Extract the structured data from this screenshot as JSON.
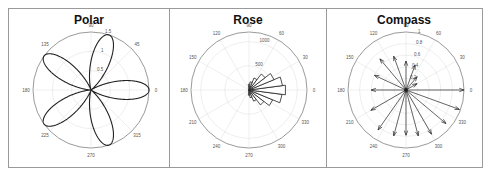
{
  "panels": [
    {
      "id": "polar",
      "title": "Polar"
    },
    {
      "id": "rose",
      "title": "Rose"
    },
    {
      "id": "compass",
      "title": "Compass"
    }
  ],
  "chart_data": [
    {
      "type": "line",
      "title": "Polar",
      "subtype": "polar rose curve (5 petals)",
      "angle_ticks": [
        "0",
        "45",
        "90",
        "135",
        "180",
        "225",
        "270",
        "315"
      ],
      "radial_ticks": [
        "0.5",
        "1",
        "1.5"
      ],
      "rlim": [
        0,
        1.5
      ],
      "petal_angles_deg": [
        0,
        72,
        144,
        216,
        288
      ],
      "petal_max_r": 1.5
    },
    {
      "type": "bar",
      "title": "Rose",
      "subtype": "rose histogram",
      "angle_ticks": [
        "0",
        "30",
        "60",
        "90",
        "120",
        "150",
        "180",
        "210",
        "240",
        "270",
        "300",
        "330"
      ],
      "radial_ticks": [
        "500",
        "1000"
      ],
      "rlim": [
        0,
        1200
      ],
      "bin_centers_deg": [
        -90,
        -75,
        -60,
        -45,
        -30,
        -15,
        0,
        15,
        30,
        45,
        60,
        75,
        90
      ],
      "counts": [
        110,
        160,
        250,
        390,
        530,
        690,
        760,
        700,
        560,
        420,
        270,
        170,
        120
      ]
    },
    {
      "type": "scatter",
      "title": "Compass",
      "subtype": "compass arrows",
      "angle_ticks": [
        "0",
        "30",
        "60",
        "90",
        "120",
        "150",
        "180",
        "210",
        "240",
        "270",
        "300",
        "330"
      ],
      "radial_ticks": [
        "0.2",
        "0.4",
        "0.6",
        "0.8",
        "1"
      ],
      "rlim": [
        0,
        1
      ],
      "arrows": [
        {
          "angle": 0,
          "r": 1.0
        },
        {
          "angle": -20,
          "r": 0.98
        },
        {
          "angle": -40,
          "r": 0.9
        },
        {
          "angle": -60,
          "r": 0.88
        },
        {
          "angle": -75,
          "r": 0.82
        },
        {
          "angle": -90,
          "r": 0.78
        },
        {
          "angle": -105,
          "r": 0.82
        },
        {
          "angle": -125,
          "r": 0.84
        },
        {
          "angle": -150,
          "r": 0.7
        },
        {
          "angle": 180,
          "r": 0.6
        },
        {
          "angle": 155,
          "r": 0.6
        },
        {
          "angle": 130,
          "r": 0.7
        },
        {
          "angle": 110,
          "r": 0.62
        },
        {
          "angle": 90,
          "r": 0.5
        },
        {
          "angle": 70,
          "r": 0.46
        },
        {
          "angle": 50,
          "r": 0.3
        },
        {
          "angle": 30,
          "r": 0.22
        }
      ]
    }
  ]
}
